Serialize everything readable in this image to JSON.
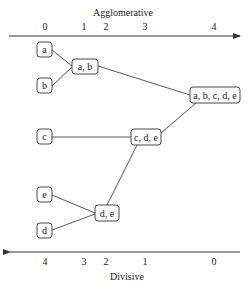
{
  "top_axis": {
    "title": "Agglomerative",
    "ticks": [
      {
        "label": "0",
        "x": 45
      },
      {
        "label": "1",
        "x": 84
      },
      {
        "label": "2",
        "x": 106
      },
      {
        "label": "3",
        "x": 145
      },
      {
        "label": "4",
        "x": 214
      }
    ],
    "direction": "right"
  },
  "bottom_axis": {
    "title": "Divisive",
    "ticks": [
      {
        "label": "4",
        "x": 45
      },
      {
        "label": "3",
        "x": 84
      },
      {
        "label": "2",
        "x": 106
      },
      {
        "label": "1",
        "x": 145
      },
      {
        "label": "0",
        "x": 214
      }
    ],
    "direction": "left"
  },
  "nodes": {
    "a": {
      "label": "a"
    },
    "b": {
      "label": "b"
    },
    "c": {
      "label": "c"
    },
    "d": {
      "label": "d"
    },
    "e": {
      "label": "e"
    },
    "ab": {
      "label": "a, b"
    },
    "de": {
      "label": "d, e"
    },
    "cde": {
      "label": "c, d, e"
    },
    "abcde": {
      "label": "a, b, c, d, e"
    }
  },
  "edges": [
    [
      "a",
      "ab"
    ],
    [
      "b",
      "ab"
    ],
    [
      "e",
      "de"
    ],
    [
      "d",
      "de"
    ],
    [
      "c",
      "cde"
    ],
    [
      "de",
      "cde"
    ],
    [
      "ab",
      "abcde"
    ],
    [
      "cde",
      "abcde"
    ]
  ]
}
